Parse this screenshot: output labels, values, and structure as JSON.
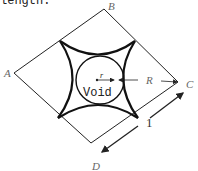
{
  "caption": "length:",
  "vertices": {
    "A": "A",
    "B": "B",
    "C": "C",
    "D": "D"
  },
  "labels": {
    "void": "Void",
    "small_radius": "r",
    "large_radius": "R",
    "side_length": "1"
  },
  "colors": {
    "line": "#222222",
    "label": "#666666",
    "background": "#ffffff"
  }
}
